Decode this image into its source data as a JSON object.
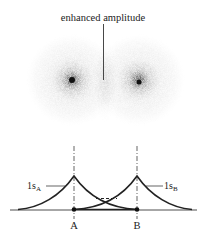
{
  "figure": {
    "title_annotation": "enhanced amplitude",
    "clouds": [
      {
        "id": "A",
        "cx": 72,
        "cy": 80,
        "r": 46
      },
      {
        "id": "B",
        "cx": 139,
        "cy": 80,
        "r": 46
      }
    ],
    "orbital_labels": {
      "a_prefix": "1s",
      "a_sub": "A",
      "b_prefix": "1s",
      "b_sub": "B"
    },
    "nucleus_labels": {
      "a": "A",
      "b": "B"
    },
    "colors": {
      "ink": "#222222",
      "cloud_light": "#d8d8d8",
      "cloud_core": "#1a1a1a"
    }
  }
}
